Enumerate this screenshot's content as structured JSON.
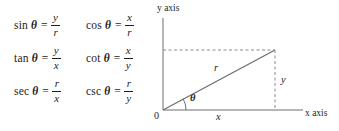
{
  "figure": {
    "type": "trigonometric-reference-triangle",
    "formulas": [
      [
        {
          "name": "sin",
          "variable": "θ",
          "equals": "=",
          "numerator": "y",
          "denominator": "r"
        },
        {
          "name": "cos",
          "variable": "θ",
          "equals": "=",
          "numerator": "x",
          "denominator": "r"
        }
      ],
      [
        {
          "name": "tan",
          "variable": "θ",
          "equals": "=",
          "numerator": "y",
          "denominator": "x"
        },
        {
          "name": "cot",
          "variable": "θ",
          "equals": "=",
          "numerator": "x",
          "denominator": "y"
        }
      ],
      [
        {
          "name": "sec",
          "variable": "θ",
          "equals": "=",
          "numerator": "r",
          "denominator": "x"
        },
        {
          "name": "csc",
          "variable": "θ",
          "equals": "=",
          "numerator": "r",
          "denominator": "y"
        }
      ]
    ],
    "diagram": {
      "y_axis_label": "y axis",
      "x_axis_label": "x axis",
      "origin_label": "0",
      "hypotenuse_label": "r",
      "horizontal_leg_label": "x",
      "vertical_leg_label": "y",
      "angle_label": "θ",
      "line_color": "#6e6e6e",
      "dash_color": "#8a8a8a",
      "text_color": "#1d1d1d"
    }
  }
}
